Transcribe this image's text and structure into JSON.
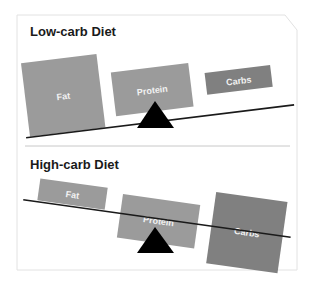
{
  "panels": [
    {
      "title": "Low-carb Diet",
      "boxes": [
        {
          "label": "Fat",
          "color": "#9b9b9b"
        },
        {
          "label": "Protein",
          "color": "#9b9b9b"
        },
        {
          "label": "Carbs",
          "color": "#808080"
        }
      ]
    },
    {
      "title": "High-carb Diet",
      "boxes": [
        {
          "label": "Fat",
          "color": "#9b9b9b"
        },
        {
          "label": "Protein",
          "color": "#9b9b9b"
        },
        {
          "label": "Carbs",
          "color": "#808080"
        }
      ]
    }
  ],
  "colors": {
    "beam": "#1a1a1a",
    "fulcrum": "#000000",
    "border": "#e2e2e2",
    "divider": "#c8c8c8"
  }
}
